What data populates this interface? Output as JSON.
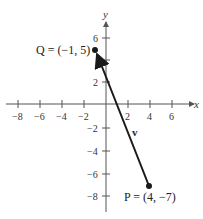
{
  "figure": {
    "x_axis_label": "x",
    "y_axis_label": "y",
    "x_ticks": [
      {
        "value": -8,
        "label": "−8"
      },
      {
        "value": -6,
        "label": "−6"
      },
      {
        "value": -4,
        "label": "−4"
      },
      {
        "value": -2,
        "label": "−2"
      },
      {
        "value": 2,
        "label": "2"
      },
      {
        "value": 4,
        "label": "4"
      },
      {
        "value": 6,
        "label": "6"
      }
    ],
    "y_ticks": [
      {
        "value": 6,
        "label": "6"
      },
      {
        "value": 4,
        "label": ""
      },
      {
        "value": 2,
        "label": "2"
      },
      {
        "value": -2,
        "label": "−2"
      },
      {
        "value": -4,
        "label": "−4"
      },
      {
        "value": -6,
        "label": "−6"
      },
      {
        "value": -8,
        "label": "−8"
      }
    ],
    "points": {
      "Q": {
        "label": "Q = (−1, 5)",
        "x": -1,
        "y": 5
      },
      "P": {
        "label": "P = (4, −7)",
        "x": 4,
        "y": -7
      }
    },
    "vector": {
      "label": "v",
      "from": "P",
      "to": "Q"
    },
    "colors": {
      "axis": "#555555",
      "vector": "#1a1a1a"
    }
  }
}
